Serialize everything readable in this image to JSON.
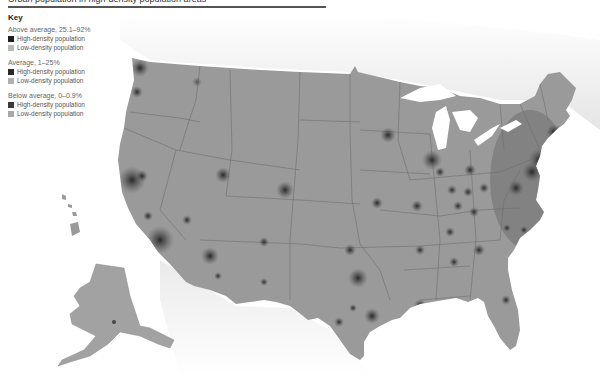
{
  "title": {
    "text": "Urban population in high-density population areas"
  },
  "key": {
    "heading": "Key",
    "groups": [
      {
        "label": "Above average, 25.1–92%",
        "items": [
          {
            "label": "High-density population",
            "color": "#1e1e1e"
          },
          {
            "label": "Low-density population",
            "color": "#b8b8b8"
          }
        ]
      },
      {
        "label": "Average, 1–25%",
        "items": [
          {
            "label": "High-density population",
            "color": "#2a2a2a"
          },
          {
            "label": "Low-density population",
            "color": "#b0b0b0"
          }
        ]
      },
      {
        "label": "Below average, 0–0.9%",
        "items": [
          {
            "label": "High-density population",
            "color": "#3a3a3a"
          },
          {
            "label": "Low-density population",
            "color": "#a8a8a8"
          }
        ]
      }
    ]
  },
  "map": {
    "land_color": "#9a9a9a",
    "water_color": "#ffffff",
    "border_color": "#6e6e6e",
    "regions": [
      "Contiguous United States",
      "Alaska",
      "Hawaii"
    ]
  }
}
